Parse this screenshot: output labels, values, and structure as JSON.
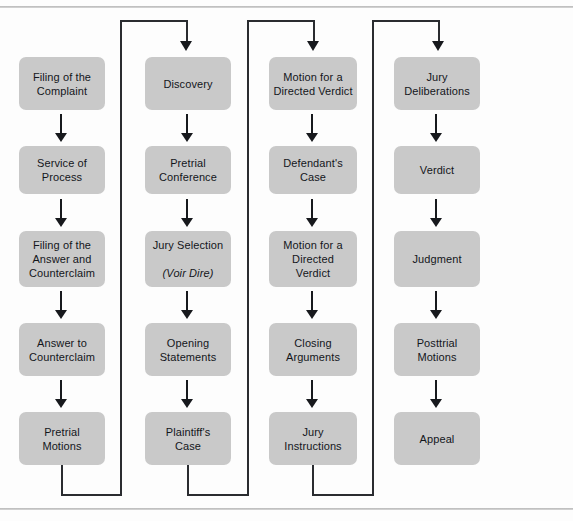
{
  "diagram": {
    "box_color": "#c9c9c9",
    "line_color": "#2a2c30",
    "columns": [
      {
        "name": "pretrial-filing",
        "nodes": [
          {
            "id": "filing-of-the-complaint",
            "label": "Filing of the\nComplaint"
          },
          {
            "id": "service-of-process",
            "label": "Service of\nProcess"
          },
          {
            "id": "filing-of-the-answer-and-counterclaim",
            "label": "Filing of the\nAnswer and\nCounterclaim"
          },
          {
            "id": "answer-to-counterclaim",
            "label": "Answer to\nCounterclaim"
          },
          {
            "id": "pretrial-motions",
            "label": "Pretrial\nMotions"
          }
        ]
      },
      {
        "name": "discovery-and-opening",
        "nodes": [
          {
            "id": "discovery",
            "label": "Discovery"
          },
          {
            "id": "pretrial-conference",
            "label": "Pretrial\nConference"
          },
          {
            "id": "jury-selection",
            "label": "Jury Selection",
            "label_italic": "(Voir Dire)"
          },
          {
            "id": "opening-statements",
            "label": "Opening\nStatements"
          },
          {
            "id": "plaintiffs-case",
            "label": "Plaintiff's\nCase"
          }
        ]
      },
      {
        "name": "trial-proceedings",
        "nodes": [
          {
            "id": "motion-for-a-directed-verdict-1",
            "label": "Motion for a\nDirected Verdict"
          },
          {
            "id": "defendants-case",
            "label": "Defendant's\nCase"
          },
          {
            "id": "motion-for-a-directed-verdict-2",
            "label": "Motion for a\nDirected\nVerdict"
          },
          {
            "id": "closing-arguments",
            "label": "Closing\nArguments"
          },
          {
            "id": "jury-instructions",
            "label": "Jury\nInstructions"
          }
        ]
      },
      {
        "name": "verdict-and-appeal",
        "nodes": [
          {
            "id": "jury-deliberations",
            "label": "Jury\nDeliberations"
          },
          {
            "id": "verdict",
            "label": "Verdict"
          },
          {
            "id": "judgment",
            "label": "Judgment"
          },
          {
            "id": "posttrial-motions",
            "label": "Posttrial\nMotions"
          },
          {
            "id": "appeal",
            "label": "Appeal"
          }
        ]
      }
    ]
  }
}
